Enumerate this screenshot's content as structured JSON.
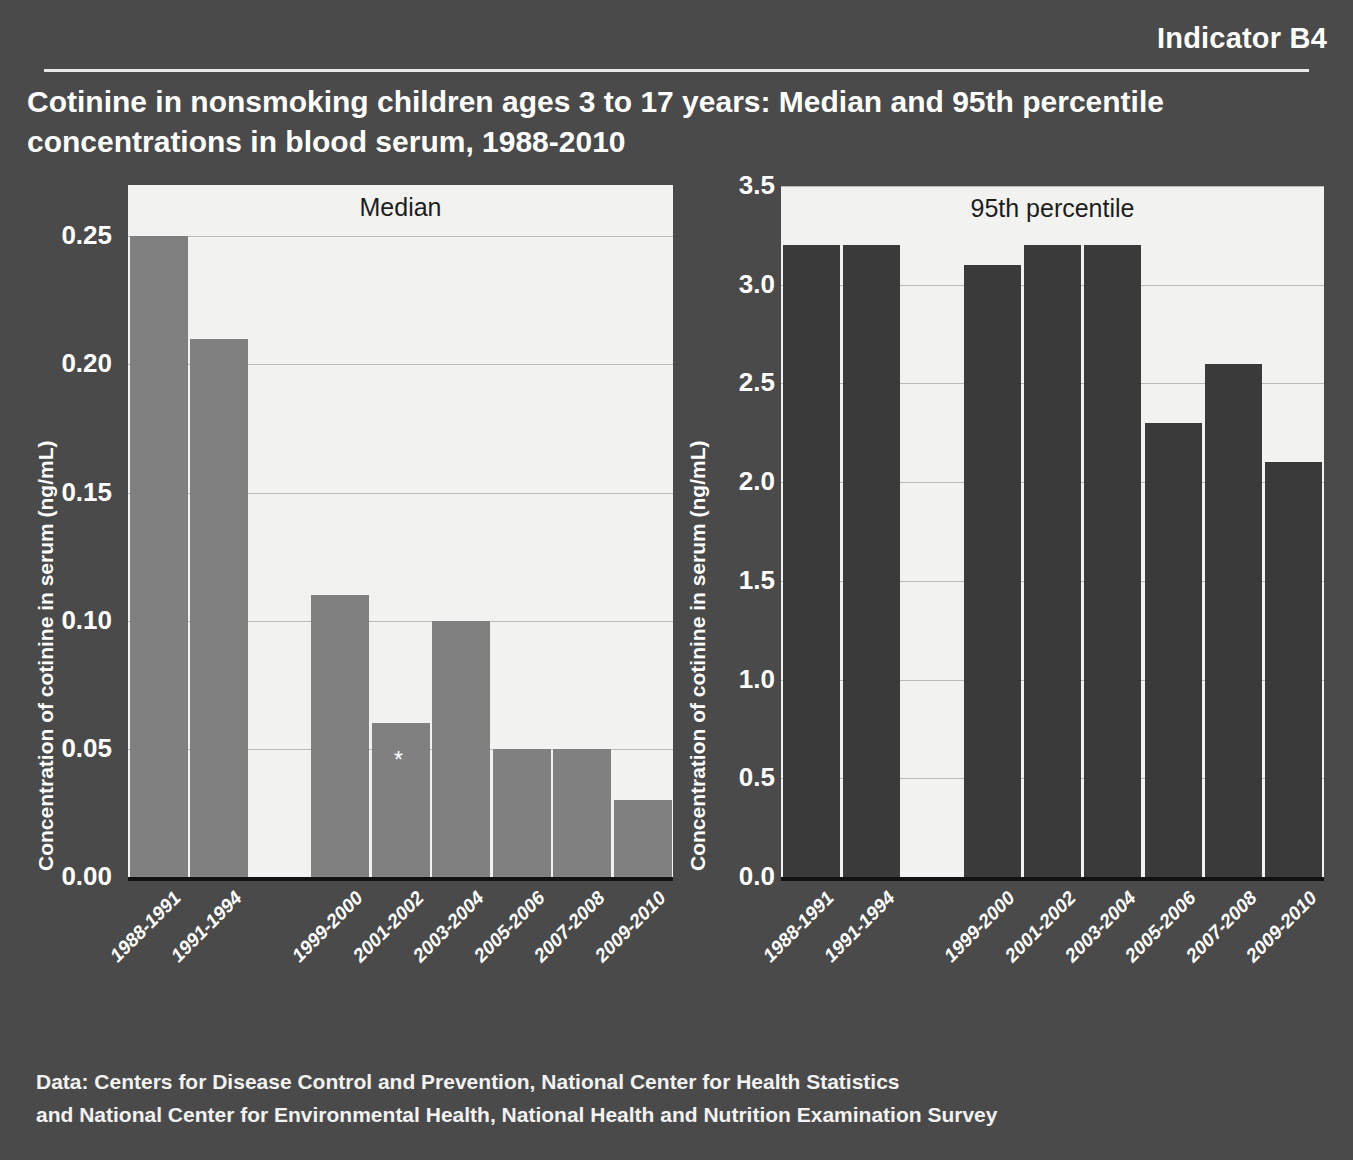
{
  "header": {
    "indicator_label": "Indicator B4",
    "title": "Cotinine in nonsmoking children ages 3 to 17 years: Median and 95th percentile concentrations in blood serum, 1988-2010"
  },
  "source": {
    "line1": "Data: Centers for Disease Control and Prevention, National Center for Health Statistics",
    "line2": "and National Center for Environmental Health, National Health and Nutrition Examination Survey"
  },
  "axis_title": "Concentration of cotinine in serum (ng/mL)",
  "colors": {
    "background": "#4a4a4a",
    "plot_background": "#f2f2f0",
    "median_bar": "#808080",
    "p95_bar": "#3a3a3a",
    "gridline": "#b9b9b5",
    "text": "#ffffff"
  },
  "footnote_marker": "*",
  "chart_data": [
    {
      "type": "bar",
      "id": "median",
      "title": "Median",
      "xlabel": "",
      "ylabel": "Concentration of cotinine in serum (ng/mL)",
      "ylim": [
        0,
        0.27
      ],
      "yticks": [
        0.0,
        0.05,
        0.1,
        0.15,
        0.2,
        0.25
      ],
      "ytick_labels": [
        "0.00",
        "0.05",
        "0.10",
        "0.15",
        "0.20",
        "0.25"
      ],
      "grid": true,
      "legend": "none",
      "categories": [
        "1988-1991",
        "1991-1994",
        "",
        "1999-2000",
        "2001-2002",
        "2003-2004",
        "2005-2006",
        "2007-2008",
        "2009-2010"
      ],
      "values": [
        0.25,
        0.21,
        null,
        0.11,
        0.06,
        0.1,
        0.05,
        0.05,
        0.03
      ],
      "annotations": [
        {
          "category": "2001-2002",
          "text": "*"
        }
      ]
    },
    {
      "type": "bar",
      "id": "p95",
      "title": "95th percentile",
      "xlabel": "",
      "ylabel": "Concentration of cotinine in serum (ng/mL)",
      "ylim": [
        0,
        3.5
      ],
      "yticks": [
        0.0,
        0.5,
        1.0,
        1.5,
        2.0,
        2.5,
        3.0,
        3.5
      ],
      "ytick_labels": [
        "0.0",
        "0.5",
        "1.0",
        "1.5",
        "2.0",
        "2.5",
        "3.0",
        "3.5"
      ],
      "grid": true,
      "legend": "none",
      "categories": [
        "1988-1991",
        "1991-1994",
        "",
        "1999-2000",
        "2001-2002",
        "2003-2004",
        "2005-2006",
        "2007-2008",
        "2009-2010"
      ],
      "values": [
        3.2,
        3.2,
        null,
        3.1,
        3.2,
        3.2,
        2.3,
        2.6,
        2.1
      ],
      "annotations": []
    }
  ]
}
